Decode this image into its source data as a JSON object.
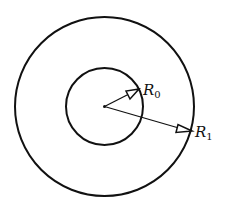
{
  "diagram": {
    "type": "concentric-circles",
    "center": {
      "x": 104.5,
      "y": 106.5
    },
    "outer_circle": {
      "radius": 89.5
    },
    "inner_circle": {
      "radius": 38.5
    },
    "stroke_color": "#111111",
    "labels": {
      "r0": {
        "main": "R",
        "sub": "0"
      },
      "r1": {
        "main": "R",
        "sub": "1"
      }
    },
    "arrows": [
      {
        "name": "R0",
        "from": [
          104.5,
          106.5
        ],
        "to": [
          139,
          89
        ]
      },
      {
        "name": "R1",
        "from": [
          104.5,
          106.5
        ],
        "to": [
          192,
          131
        ]
      }
    ]
  }
}
